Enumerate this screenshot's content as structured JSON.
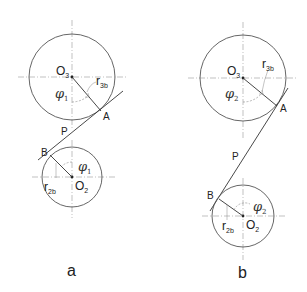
{
  "diagrams": [
    {
      "id": "a",
      "caption": "a",
      "upper_circle": {
        "center_label": "O",
        "center_sub": "3",
        "radius_label": "r",
        "radius_sub": "3b",
        "angle_label": "φ",
        "angle_sub": "1",
        "tangent_point": "A"
      },
      "lower_circle": {
        "center_label": "O",
        "center_sub": "2",
        "radius_label": "r",
        "radius_sub": "2b",
        "angle_label": "φ",
        "angle_sub": "1",
        "tangent_point": "B"
      },
      "pitch_point": "P"
    },
    {
      "id": "b",
      "caption": "b",
      "upper_circle": {
        "center_label": "O",
        "center_sub": "3",
        "radius_label": "r",
        "radius_sub": "3b",
        "angle_label": "φ",
        "angle_sub": "2",
        "tangent_point": "A"
      },
      "lower_circle": {
        "center_label": "O",
        "center_sub": "2",
        "radius_label": "r",
        "radius_sub": "2b",
        "angle_label": "φ",
        "angle_sub": "2",
        "tangent_point": "B"
      },
      "pitch_point": "P"
    }
  ]
}
